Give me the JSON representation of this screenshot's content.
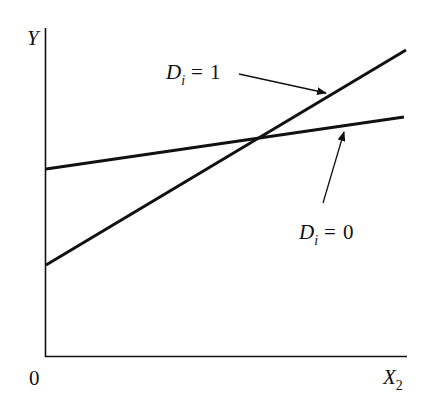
{
  "diagram": {
    "title": "",
    "axes": {
      "y_label": "Y",
      "x_label": "X",
      "x_label_subscript": "2",
      "origin_label": "0"
    },
    "lines": [
      {
        "id": "d1",
        "label_var": "D",
        "label_subscript": "i",
        "label_eq": "=",
        "label_value": "1",
        "description": "steeper line, lower intercept",
        "start": [
          46,
          265
        ],
        "end": [
          406,
          50
        ]
      },
      {
        "id": "d0",
        "label_var": "D",
        "label_subscript": "i",
        "label_eq": "=",
        "label_value": "0",
        "description": "flatter line, higher intercept",
        "start": [
          46,
          169
        ],
        "end": [
          404,
          117
        ]
      }
    ],
    "colors": {
      "ink": "#111111",
      "background": "#ffffff"
    }
  }
}
